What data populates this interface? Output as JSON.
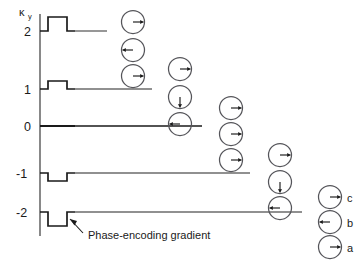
{
  "figure": {
    "axis": {
      "y_label_main": "κ",
      "y_label_sub": "y",
      "ticks": [
        {
          "label": "2",
          "value": 2,
          "y": 31
        },
        {
          "label": "1",
          "value": 1,
          "y": 89
        },
        {
          "label": "0",
          "value": 0,
          "y": 126
        },
        {
          "label": "-1",
          "value": -1,
          "y": 173
        },
        {
          "label": "-2",
          "value": -2,
          "y": 212
        }
      ]
    },
    "annotation": {
      "text": "Phase-encoding gradient"
    },
    "legend": {
      "items": [
        {
          "label": "c",
          "arrow": "right",
          "angle": 0
        },
        {
          "label": "b",
          "arrow": "left",
          "angle": 180
        },
        {
          "label": "a",
          "arrow": "right",
          "angle": 0
        }
      ]
    },
    "colors": {
      "ink": "#1a1a1a",
      "line": "#6b6b6b",
      "circle": "#55555a",
      "background": "#ffffff"
    }
  },
  "chart_data": {
    "type": "line",
    "title": "",
    "xlabel": "",
    "ylabel": "κ_y",
    "ytick_labels": [
      "2",
      "1",
      "0",
      "-1",
      "-2"
    ],
    "yvalues": [
      2,
      1,
      0,
      -1,
      -2
    ],
    "grid": false,
    "legend_position": "bottom-right",
    "rows": [
      {
        "k": 2,
        "y": 31,
        "pulse": {
          "polarity": "positive",
          "amplitude": 14,
          "start": 40,
          "rise": 48,
          "fall": 67,
          "end": 75
        },
        "readout": {
          "x_start": 75,
          "x_end": 107
        },
        "phasors": []
      },
      {
        "k": 1,
        "y": 89,
        "pulse": {
          "polarity": "positive",
          "amplitude": 8,
          "start": 40,
          "rise": 48,
          "fall": 67,
          "end": 75
        },
        "readout": {
          "x_start": 75,
          "x_end": 152
        },
        "phasors": []
      },
      {
        "k": 0,
        "y": 126,
        "pulse": {
          "polarity": "none",
          "amplitude": 0,
          "start": 40,
          "rise": 48,
          "fall": 67,
          "end": 75
        },
        "readout": {
          "x_start": 40,
          "x_end": 202
        },
        "phasors": []
      },
      {
        "k": -1,
        "y": 173,
        "pulse": {
          "polarity": "negative",
          "amplitude": 8,
          "start": 40,
          "rise": 48,
          "fall": 67,
          "end": 75
        },
        "readout": {
          "x_start": 75,
          "x_end": 250
        },
        "phasors": []
      },
      {
        "k": -2,
        "y": 212,
        "pulse": {
          "polarity": "negative",
          "amplitude": 14,
          "start": 40,
          "rise": 48,
          "fall": 67,
          "end": 75
        },
        "readout": {
          "x_start": 75,
          "x_end": 302
        },
        "phasors": []
      }
    ],
    "phasor_columns": [
      {
        "column": 1,
        "cx": 133,
        "phasors": [
          {
            "cy": 22,
            "angle": 0,
            "direction": "right"
          },
          {
            "cy": 50,
            "angle": 180,
            "direction": "left"
          },
          {
            "cy": 76,
            "angle": 0,
            "direction": "right"
          }
        ]
      },
      {
        "column": 2,
        "cx": 180,
        "phasors": [
          {
            "cy": 69,
            "angle": 0,
            "direction": "right"
          },
          {
            "cy": 97,
            "angle": 90,
            "direction": "down"
          },
          {
            "cy": 124,
            "angle": 180,
            "direction": "left"
          }
        ]
      },
      {
        "column": 3,
        "cx": 231,
        "phasors": [
          {
            "cy": 108,
            "angle": 0,
            "direction": "right"
          },
          {
            "cy": 134,
            "angle": 0,
            "direction": "right"
          },
          {
            "cy": 160,
            "angle": 0,
            "direction": "right"
          }
        ]
      },
      {
        "column": 4,
        "cx": 280,
        "phasors": [
          {
            "cy": 155,
            "angle": 0,
            "direction": "right"
          },
          {
            "cy": 182,
            "angle": 90,
            "direction": "down"
          },
          {
            "cy": 208,
            "angle": 180,
            "direction": "left"
          }
        ]
      }
    ],
    "legend_phasors": [
      {
        "cx": 330,
        "cy": 197,
        "angle": 0,
        "label": "c"
      },
      {
        "cx": 330,
        "cy": 222,
        "angle": 180,
        "label": "b"
      },
      {
        "cx": 330,
        "cy": 247,
        "angle": 0,
        "label": "a"
      }
    ]
  }
}
